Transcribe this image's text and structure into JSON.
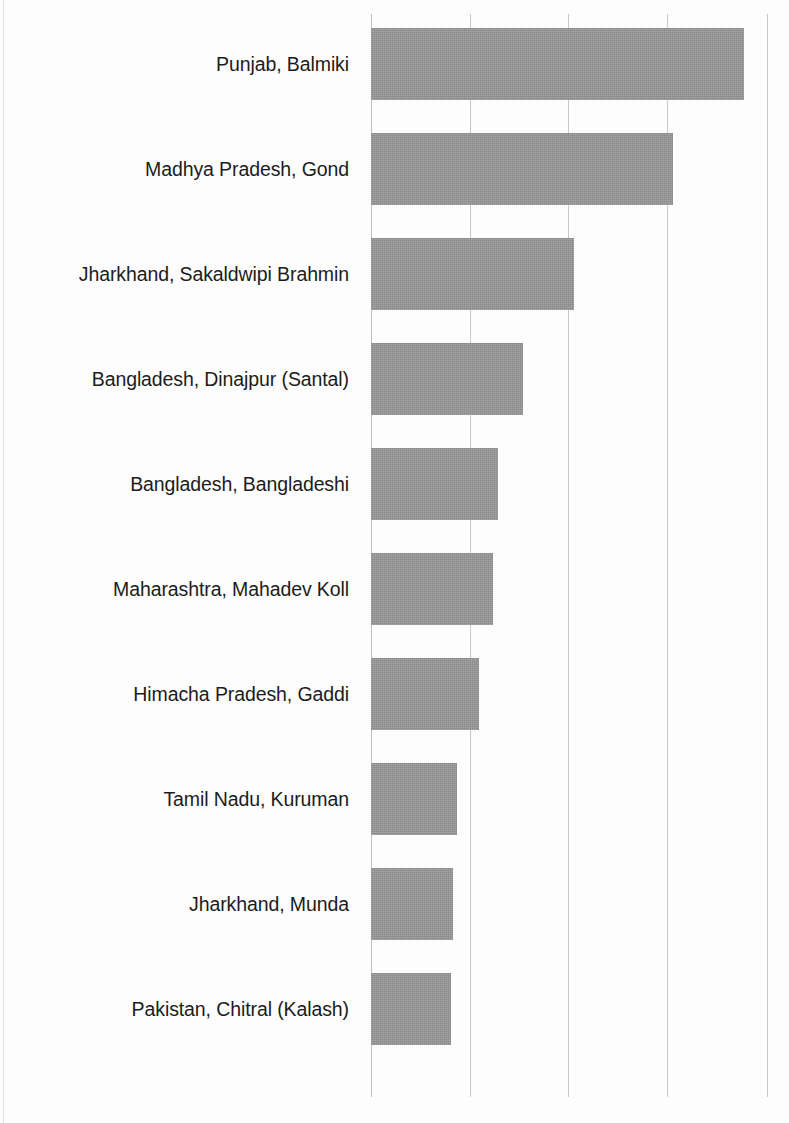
{
  "chart_data": {
    "type": "bar",
    "orientation": "horizontal",
    "title": "",
    "subtitle": "",
    "xlabel": "",
    "ylabel": "",
    "categories": [
      "Punjab, Balmiki",
      "Madhya Pradesh, Gond",
      "Jharkhand, Sakaldwipi Brahmin",
      "Bangladesh, Dinajpur (Santal)",
      "Bangladesh, Bangladeshi",
      "Maharashtra, Mahadev Koll",
      "Himacha Pradesh, Gaddi",
      "Tamil Nadu, Kuruman",
      "Jharkhand, Munda",
      "Pakistan, Chitral (Kalash)"
    ],
    "values": [
      3.77,
      3.05,
      2.05,
      1.54,
      1.28,
      1.23,
      1.09,
      0.87,
      0.83,
      0.81
    ],
    "xlim": [
      0,
      4
    ],
    "xticks": [
      0,
      1,
      2,
      3,
      4
    ],
    "xtick_labels": [
      "",
      "",
      "",
      "",
      ""
    ],
    "ytick_labels_shown": true,
    "grid": "vertical",
    "legend": "none",
    "bar_color": "#9a9a9a",
    "gridline_color": "#c9c9c9",
    "background_color": "#ffffff",
    "annotations": []
  },
  "bars": [
    {
      "label": "Punjab, Balmiki",
      "value": 3.77,
      "top": 28,
      "height": 72,
      "width": 373
    },
    {
      "label": "Madhya Pradesh, Gond",
      "value": 3.05,
      "top": 133,
      "height": 72,
      "width": 302
    },
    {
      "label": "Jharkhand, Sakaldwipi Brahmin",
      "value": 2.05,
      "top": 238,
      "height": 72,
      "width": 203
    },
    {
      "label": "Bangladesh, Dinajpur (Santal)",
      "value": 1.54,
      "top": 343,
      "height": 72,
      "width": 152
    },
    {
      "label": "Bangladesh, Bangladeshi",
      "value": 1.28,
      "top": 448,
      "height": 72,
      "width": 127
    },
    {
      "label": "Maharashtra, Mahadev Koll",
      "value": 1.23,
      "top": 553,
      "height": 72,
      "width": 122
    },
    {
      "label": "Himacha Pradesh, Gaddi",
      "value": 1.09,
      "top": 658,
      "height": 72,
      "width": 108
    },
    {
      "label": "Tamil Nadu, Kuruman",
      "value": 0.87,
      "top": 763,
      "height": 72,
      "width": 86
    },
    {
      "label": "Jharkhand, Munda",
      "value": 0.83,
      "top": 868,
      "height": 72,
      "width": 82
    },
    {
      "label": "Pakistan, Chitral (Kalash)",
      "value": 0.81,
      "top": 973,
      "height": 72,
      "width": 80
    }
  ],
  "labels": [
    {
      "text": "Punjab, Balmiki",
      "top": 53
    },
    {
      "text": "Madhya Pradesh, Gond",
      "top": 158
    },
    {
      "text": "Jharkhand, Sakaldwipi Brahmin",
      "top": 263
    },
    {
      "text": "Bangladesh, Dinajpur (Santal)",
      "top": 368
    },
    {
      "text": "Bangladesh, Bangladeshi",
      "top": 473
    },
    {
      "text": "Maharashtra, Mahadev Koll",
      "top": 578
    },
    {
      "text": "Himacha Pradesh, Gaddi",
      "top": 683
    },
    {
      "text": "Tamil Nadu, Kuruman",
      "top": 788
    },
    {
      "text": "Jharkhand, Munda",
      "top": 893
    },
    {
      "text": "Pakistan, Chitral (Kalash)",
      "top": 998
    }
  ],
  "gridlines": [
    {
      "x": 0,
      "is_axis": true
    },
    {
      "x": 99,
      "is_axis": false
    },
    {
      "x": 197,
      "is_axis": false
    },
    {
      "x": 296,
      "is_axis": false
    },
    {
      "x": 396,
      "is_axis": false
    }
  ]
}
